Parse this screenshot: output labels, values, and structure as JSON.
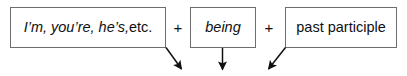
{
  "diagram": {
    "type": "formula-boxes-with-arrows",
    "background_color": "#ffffff",
    "box_border_color": "#6e6e6e",
    "text_color": "#101010",
    "arrow_color": "#101010",
    "boxes": [
      {
        "id": "subject",
        "italic_text": "I’m, you’re, he’s,",
        "roman_text": " etc.",
        "arrow": "diagonal-down-right"
      },
      {
        "id": "being",
        "italic_text": "being",
        "roman_text": "",
        "arrow": "vertical-down"
      },
      {
        "id": "participle",
        "italic_text": "",
        "roman_text": "past participle",
        "arrow": "diagonal-down-left"
      }
    ],
    "operators": {
      "first_plus": "+",
      "second_plus": "+"
    }
  }
}
